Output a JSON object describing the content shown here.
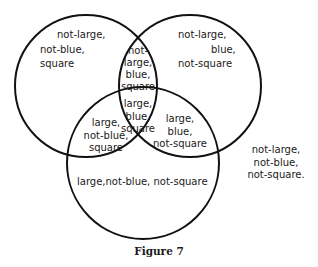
{
  "diagram": {
    "type": "venn",
    "sets": [
      "large",
      "blue",
      "square"
    ],
    "circles": [
      {
        "name": "not-large circle (left)",
        "cx": 86,
        "cy": 86,
        "r": 71
      },
      {
        "name": "blue circle (right)",
        "cx": 190,
        "cy": 86,
        "r": 71
      },
      {
        "name": "large circle (bottom)",
        "cx": 143,
        "cy": 163,
        "r": 76
      }
    ],
    "stroke_color": "#111111"
  },
  "regions": {
    "left_only": [
      "not-large,",
      "not-blue,",
      "square"
    ],
    "right_only": [
      "not-large,",
      "blue,",
      "not-square"
    ],
    "left_right": [
      "not-",
      "large,",
      "blue,",
      "square"
    ],
    "all_three": [
      "large,",
      "blue,",
      "square"
    ],
    "left_bottom": [
      "large,",
      "not-blue,",
      "square"
    ],
    "right_bottom": [
      "large,",
      "blue,",
      "not-square"
    ],
    "bottom_only": "large,not-blue, not-square",
    "outside": [
      "not-large,",
      "not-blue,",
      "not-square."
    ]
  },
  "caption": "Figure 7"
}
